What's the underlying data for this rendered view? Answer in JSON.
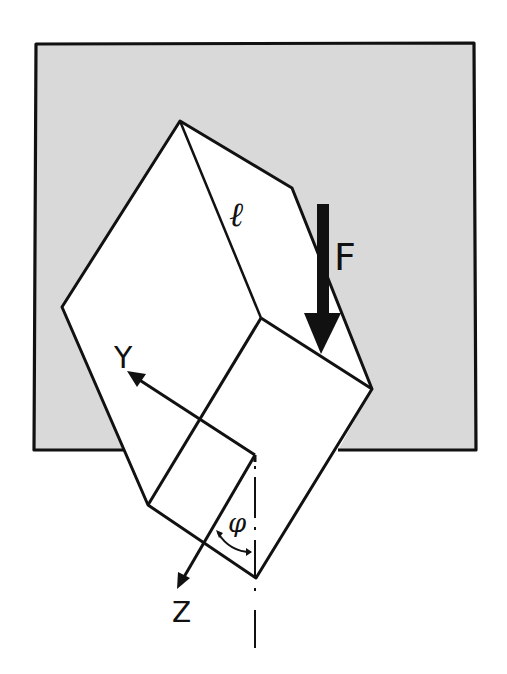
{
  "diagram": {
    "type": "mechanics-sketch",
    "colors": {
      "background": "#ffffff",
      "slot_fill": "#d9d9d9",
      "stroke": "#111111",
      "block_fill": "#ffffff"
    },
    "labels": {
      "length": "ℓ",
      "force": "F",
      "axis_y": "Y",
      "axis_z": "Z",
      "angle": "φ"
    },
    "elements": [
      {
        "name": "slot-background",
        "kind": "rect"
      },
      {
        "name": "block",
        "kind": "polygon"
      },
      {
        "name": "force-arrow",
        "label": "F",
        "direction": "down"
      },
      {
        "name": "y-axis-arrow",
        "label": "Y"
      },
      {
        "name": "z-axis-arrow",
        "label": "Z"
      },
      {
        "name": "vertical-centerline",
        "style": "dash-dot"
      },
      {
        "name": "angle-arc",
        "label": "φ"
      }
    ]
  }
}
